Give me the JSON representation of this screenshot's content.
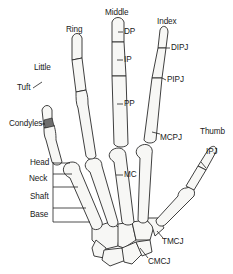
{
  "diagram": {
    "finger_labels": {
      "little": "Little",
      "ring": "Ring",
      "middle": "Middle",
      "index": "Index",
      "thumb": "Thumb"
    },
    "structure_labels": {
      "tuft": "Tuft",
      "condyles": "Condyles",
      "dp": "DP",
      "ip": "IP",
      "pp": "PP",
      "mc": "MC",
      "dipj": "DIPJ",
      "pipj": "PIPJ",
      "mcpj": "MCPJ",
      "ipj": "IPJ",
      "tmcj": "TMCJ",
      "cmcj": "CMCJ"
    },
    "metacarpal_parts": {
      "head": "Head",
      "neck": "Neck",
      "shaft": "Shaft",
      "base": "Base"
    },
    "colors": {
      "bone_fill": "#f7f7f5",
      "outline": "#2a2a2a",
      "condyles_highlight": "#6e6e6e",
      "background": "#ffffff"
    }
  }
}
